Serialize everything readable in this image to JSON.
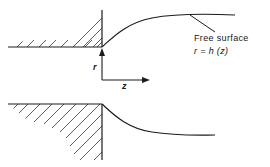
{
  "figure": {
    "background_color": "#ffffff",
    "line_color": "#1a1c1e",
    "hatch_color": "#4a4d50",
    "annotations": {
      "free_surface_label": "Free surface",
      "free_surface_equation": "r = h (z)"
    },
    "axes": {
      "vertical_label": "r",
      "horizontal_label": "z",
      "origin_x": 102,
      "origin_y": 80,
      "vertical_arrow_tip_y": 48,
      "horizontal_arrow_tip_x": 150
    },
    "upper_panel": {
      "name": "upper-wall-and-free-surface",
      "baseline_y": 47,
      "baseline_x_start": 8,
      "baseline_x_end": 102,
      "wall_x": 102,
      "wall_y_top": 10,
      "wall_y_bottom": 47,
      "curve_start": [
        102,
        47
      ],
      "curve_end": [
        235,
        15
      ],
      "curve_asymptote_r": 15,
      "hatch_side": "below-and-left"
    },
    "lower_panel": {
      "name": "lower-wall-and-free-surface",
      "baseline_y": 104,
      "baseline_x_start": 8,
      "baseline_x_end": 102,
      "wall_x": 102,
      "wall_y_top": 104,
      "wall_y_bottom": 160,
      "curve_start": [
        102,
        104
      ],
      "curve_end": [
        215,
        135
      ],
      "curve_asymptote_r": 135,
      "hatch_side": "below-and-left"
    },
    "leader_line": {
      "name": "free-surface-leader",
      "from": [
        215,
        32
      ],
      "to": [
        190,
        15
      ]
    }
  }
}
